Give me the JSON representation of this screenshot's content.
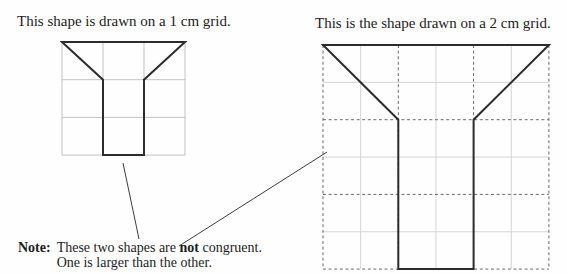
{
  "colors": {
    "background": "#fefefe",
    "title_text": "#1c1c1c",
    "shape_stroke": "#2c2c2c",
    "small_grid_line": "#c2c2c2",
    "dashed_grid_line": "#6a6a6a",
    "subgrid_line": "#d4d4d4",
    "leader_line": "#3c3c3c"
  },
  "left_panel": {
    "title": "This shape is drawn on a 1 cm grid.",
    "grid_unit_label": "1 cm",
    "grid": {
      "cols": 3,
      "rows": 3,
      "x": 62,
      "y": 42,
      "cell_w": 41,
      "cell_h": 37.7,
      "style": "solid"
    },
    "shape_vertices_units": [
      [
        0,
        0
      ],
      [
        3,
        0
      ],
      [
        2,
        1
      ],
      [
        2,
        3
      ],
      [
        1,
        3
      ],
      [
        1,
        1
      ]
    ]
  },
  "right_panel": {
    "title": "This is the shape drawn on a 2 cm grid.",
    "grid_unit_label": "2 cm",
    "grid": {
      "cols": 3,
      "rows": 3,
      "x": 323,
      "y": 45,
      "cell_w": 75.3,
      "cell_h": 74.7,
      "style": "dashed-with-midlines"
    },
    "shape_vertices_units": [
      [
        0,
        0
      ],
      [
        3,
        0
      ],
      [
        2,
        1
      ],
      [
        2,
        3
      ],
      [
        1,
        3
      ],
      [
        1,
        1
      ]
    ]
  },
  "note": {
    "label": "Note:",
    "line1_prefix": "These two shapes are ",
    "line1_bold": "not",
    "line1_suffix": " congruent.",
    "line2": "One is larger than the other."
  },
  "leader_lines": [
    {
      "x1": 123,
      "y1": 163,
      "x2": 139,
      "y2": 239
    },
    {
      "x1": 179,
      "y1": 246,
      "x2": 327,
      "y2": 152
    }
  ]
}
